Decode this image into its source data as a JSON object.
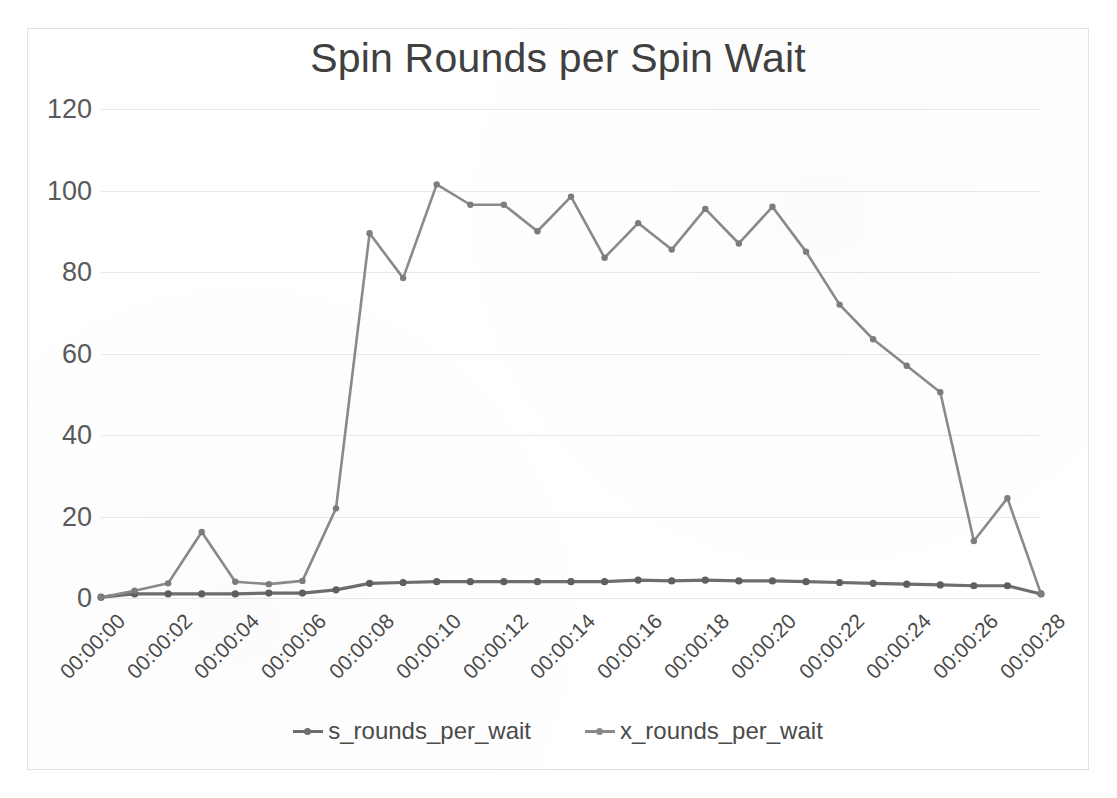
{
  "chart_data": {
    "type": "line",
    "title": "Spin Rounds per Spin Wait",
    "xlabel": "",
    "ylabel": "",
    "ylim": [
      0,
      120
    ],
    "yticks": [
      0,
      20,
      40,
      60,
      80,
      100,
      120
    ],
    "grid": true,
    "legend_position": "bottom",
    "line_color": "#808080",
    "marker_color": "#707070",
    "categories": [
      "00:00:00",
      "00:00:01",
      "00:00:02",
      "00:00:03",
      "00:00:04",
      "00:00:05",
      "00:00:06",
      "00:00:07",
      "00:00:08",
      "00:00:09",
      "00:00:10",
      "00:00:11",
      "00:00:12",
      "00:00:13",
      "00:00:14",
      "00:00:15",
      "00:00:16",
      "00:00:17",
      "00:00:18",
      "00:00:19",
      "00:00:20",
      "00:00:21",
      "00:00:22",
      "00:00:23",
      "00:00:24",
      "00:00:25",
      "00:00:26",
      "00:00:27",
      "00:00:28"
    ],
    "xticklabels": [
      "00:00:00",
      "00:00:02",
      "00:00:04",
      "00:00:06",
      "00:00:08",
      "00:00:10",
      "00:00:12",
      "00:00:14",
      "00:00:16",
      "00:00:18",
      "00:00:20",
      "00:00:22",
      "00:00:24",
      "00:00:26",
      "00:00:28"
    ],
    "series": [
      {
        "name": "s_rounds_per_wait",
        "values": [
          0.2,
          1.0,
          1.0,
          1.0,
          1.0,
          1.2,
          1.2,
          2.0,
          3.6,
          3.8,
          4.0,
          4.0,
          4.0,
          4.0,
          4.0,
          4.0,
          4.4,
          4.2,
          4.4,
          4.2,
          4.2,
          4.0,
          3.8,
          3.6,
          3.4,
          3.2,
          3.0,
          3.0,
          1.0
        ]
      },
      {
        "name": "x_rounds_per_wait",
        "values": [
          0.2,
          1.8,
          3.6,
          16.2,
          4.0,
          3.4,
          4.2,
          22.0,
          89.5,
          78.5,
          101.5,
          96.5,
          96.5,
          90.0,
          98.5,
          83.5,
          92.0,
          85.5,
          95.5,
          87.0,
          96.0,
          85.0,
          72.0,
          63.5,
          57.0,
          50.5,
          14.0,
          24.5,
          1.0
        ]
      }
    ]
  },
  "legend": {
    "entries": [
      {
        "label": "s_rounds_per_wait",
        "color": "#6e6e6e"
      },
      {
        "label": "x_rounds_per_wait",
        "color": "#8a8a8a"
      }
    ]
  }
}
